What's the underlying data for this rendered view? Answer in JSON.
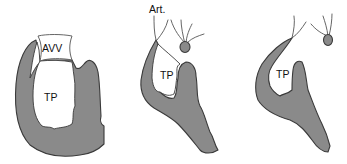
{
  "figure": {
    "panels": [
      {
        "id": "panel-1",
        "labels": {
          "valve": "AVV",
          "cavity": "TP"
        }
      },
      {
        "id": "panel-2",
        "labels": {
          "vessel": "Art.",
          "cavity": "TP"
        }
      },
      {
        "id": "panel-3",
        "labels": {
          "cavity": "TP"
        }
      }
    ],
    "colors": {
      "tissue_fill": "#8a8a8a",
      "outline": "#3a3a3a",
      "background": "#ffffff"
    }
  }
}
